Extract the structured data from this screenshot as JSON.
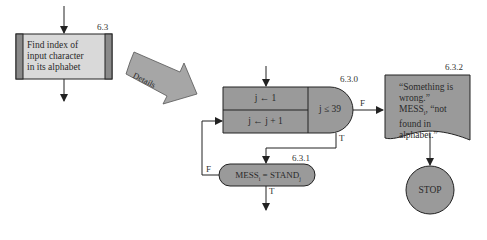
{
  "diagram": {
    "type": "flowchart",
    "colors": {
      "fill_light": "#d9d9d9",
      "fill_dark": "#9a9a9a",
      "stripe": "#8a8a8a",
      "stroke": "#222222",
      "arrow_fill": "#a6a6a6"
    },
    "nodes": {
      "process": {
        "id": "6.3",
        "lines": [
          "Find index of",
          "input character",
          "in its alphabet"
        ]
      },
      "details_arrow": {
        "label": "Details"
      },
      "loop": {
        "id": "6.3.0",
        "init": "j ← 1",
        "increment": "j ← j + 1",
        "condition": "j ≤ 39",
        "false_label": "F",
        "true_label": "T"
      },
      "compare": {
        "id": "6.3.1",
        "left": "MESS",
        "left_sub": "i",
        "op": "=",
        "right": "STAND",
        "right_sub": "j",
        "false_label": "F",
        "true_label": "T"
      },
      "output": {
        "id": "6.3.2",
        "lines": [
          "“Something is",
          "wrong.”",
          "MESS",
          "found in",
          "alphabet.”"
        ],
        "mess_sub": "i",
        "mess_tail": ", “not"
      },
      "stop": {
        "label": "STOP"
      }
    }
  }
}
